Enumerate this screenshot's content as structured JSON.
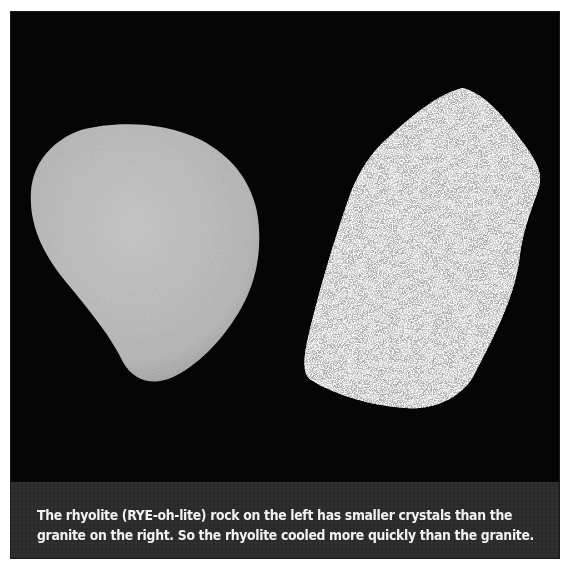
{
  "figure": {
    "background_color": "#050505",
    "caption_bar_color": "#2b2b2b",
    "rocks": [
      {
        "name": "rhyolite",
        "position": "left",
        "texture": "fine-grained",
        "color": "#b4b4b4"
      },
      {
        "name": "granite",
        "position": "right",
        "texture": "coarse-grained speckled",
        "color": "#c8c8c8"
      }
    ],
    "caption": {
      "line1": "The rhyolite (RYE-oh-lite) rock on the left has smaller crystals than the",
      "line2": "granite on the right.  So the rhyolite cooled more quickly than the granite."
    }
  }
}
